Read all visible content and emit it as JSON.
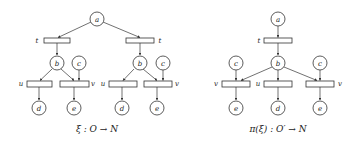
{
  "left": {
    "caption": "ξ : O → N",
    "places": {
      "a": "a",
      "b1": "b",
      "c1": "c",
      "d1": "d",
      "e1": "e",
      "b2": "b",
      "c2": "c",
      "d2": "d",
      "e2": "e"
    },
    "transitions": {
      "t1": "t",
      "t2": "t",
      "u1": "u",
      "v1": "v",
      "u2": "u",
      "v2": "v"
    }
  },
  "right": {
    "caption": "π(ξ) : O′ → N",
    "places": {
      "a": "a",
      "b": "b",
      "c1": "c",
      "c2": "c",
      "e1": "e",
      "d": "d",
      "e2": "e"
    },
    "transitions": {
      "t": "t",
      "v1": "v",
      "u": "u",
      "v2": "v"
    }
  }
}
